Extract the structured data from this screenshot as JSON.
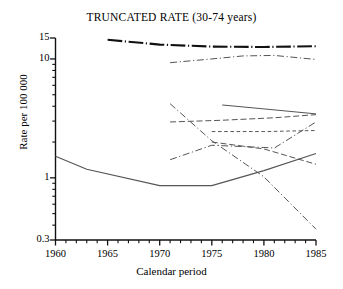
{
  "chart_data": {
    "type": "line",
    "title": "TRUNCATED RATE (30-74 years)",
    "xlabel": "Calendar period",
    "ylabel": "Rate per 100 000",
    "yscale": "log",
    "ylim": [
      0.3,
      15
    ],
    "xlim": [
      1960,
      1985
    ],
    "grid": false,
    "legend": "none",
    "y_ticks": [
      {
        "value": 15,
        "label": "15"
      },
      {
        "value": 10,
        "label": "10"
      },
      {
        "value": 1,
        "label": "1"
      },
      {
        "value": 0.3,
        "label": "0.3"
      }
    ],
    "y_minor_ticks": [
      9,
      8,
      7,
      6,
      5,
      4,
      3,
      2,
      0.9,
      0.8,
      0.7,
      0.6,
      0.5,
      0.4
    ],
    "x_ticks": [
      {
        "value": 1960,
        "label": "1960"
      },
      {
        "value": 1965,
        "label": "1965"
      },
      {
        "value": 1970,
        "label": "1970"
      },
      {
        "value": 1975,
        "label": "1975"
      },
      {
        "value": 1980,
        "label": "1980"
      },
      {
        "value": 1985,
        "label": "1985"
      }
    ],
    "x_minor_ticks": [
      1961,
      1962,
      1963,
      1964,
      1966,
      1967,
      1968,
      1969,
      1971,
      1972,
      1973,
      1974,
      1976,
      1977,
      1978,
      1979,
      1981,
      1982,
      1983,
      1984
    ],
    "series": [
      {
        "name": "series-1-thick-dashdot-top",
        "style": "dash-dot",
        "width": 2.1,
        "color": "#111111",
        "x": [
          1965,
          1970,
          1975,
          1980,
          1985
        ],
        "y": [
          14.5,
          13.2,
          12.7,
          12.6,
          12.8
        ]
      },
      {
        "name": "series-2-dashdot-upper",
        "style": "dash-dot",
        "width": 1.0,
        "color": "#555555",
        "x": [
          1971,
          1975,
          1978,
          1981,
          1985
        ],
        "y": [
          9.3,
          10.0,
          10.6,
          10.7,
          9.9
        ]
      },
      {
        "name": "series-3-solid-upper",
        "style": "solid",
        "width": 1.0,
        "color": "#555555",
        "x": [
          1976,
          1980,
          1985
        ],
        "y": [
          4.1,
          3.8,
          3.45
        ]
      },
      {
        "name": "series-4-dashed-long",
        "style": "dashed-long",
        "width": 1.0,
        "color": "#555555",
        "x": [
          1971,
          1976,
          1981,
          1985
        ],
        "y": [
          2.95,
          3.05,
          3.2,
          3.4
        ]
      },
      {
        "name": "series-5-dashed-short",
        "style": "dashed-short",
        "width": 1.0,
        "color": "#555555",
        "x": [
          1975,
          1980,
          1985
        ],
        "y": [
          2.45,
          2.45,
          2.5
        ]
      },
      {
        "name": "series-6-dashdot-rising",
        "style": "dash-dot",
        "width": 1.0,
        "color": "#555555",
        "x": [
          1971,
          1975,
          1980,
          1981,
          1985
        ],
        "y": [
          1.42,
          1.88,
          1.8,
          1.78,
          2.95
        ]
      },
      {
        "name": "series-7-dashdot-falling",
        "style": "dash-dot",
        "width": 1.0,
        "color": "#555555",
        "x": [
          1971,
          1975,
          1980,
          1985
        ],
        "y": [
          4.2,
          2.05,
          1.02,
          0.37
        ]
      },
      {
        "name": "series-8-dashed-decline",
        "style": "dashed-long",
        "width": 1.0,
        "color": "#555555",
        "x": [
          1975,
          1980,
          1985
        ],
        "y": [
          2.0,
          1.75,
          1.3
        ]
      },
      {
        "name": "series-9-solid-bottom",
        "style": "solid",
        "width": 1.1,
        "color": "#555555",
        "x": [
          1960,
          1963,
          1970,
          1975,
          1980,
          1985
        ],
        "y": [
          1.52,
          1.18,
          0.86,
          0.86,
          1.15,
          1.6
        ]
      }
    ]
  }
}
